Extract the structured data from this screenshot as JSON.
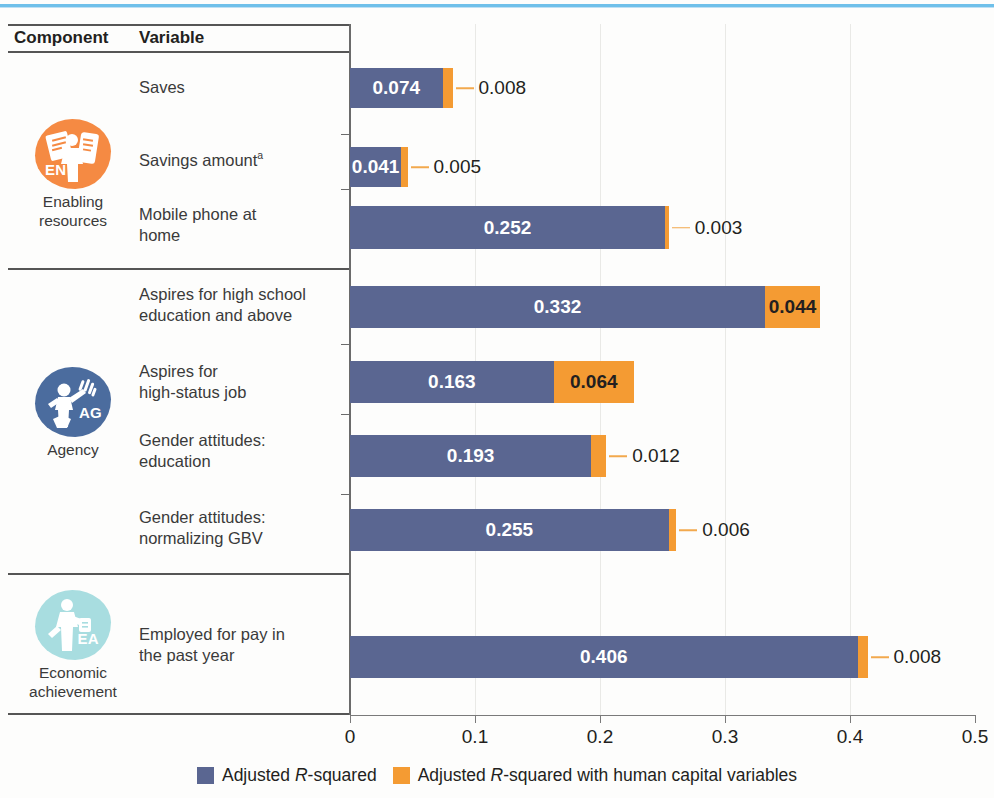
{
  "table": {
    "headers": {
      "component": "Component",
      "variable": "Variable"
    },
    "groups": [
      {
        "name": "Enabling\nresources",
        "name_line1": "Enabling",
        "name_line2": "resources",
        "code": "EN",
        "color": "#f58a43"
      },
      {
        "name": "Agency",
        "name_line1": "Agency",
        "name_line2": "",
        "code": "AG",
        "color": "#4b6c9e"
      },
      {
        "name": "Economic\nachievement",
        "name_line1": "Economic",
        "name_line2": "achievement",
        "code": "EA",
        "color": "#a8dde0"
      }
    ]
  },
  "chart_data": {
    "type": "bar",
    "orientation": "horizontal",
    "stacked": true,
    "title": "",
    "xlabel": "",
    "ylabel": "",
    "xlim": [
      0,
      0.5
    ],
    "xticks": [
      "0",
      "0.1",
      "0.2",
      "0.3",
      "0.4",
      "0.5"
    ],
    "xtick_values": [
      0,
      0.1,
      0.2,
      0.3,
      0.4,
      0.5
    ],
    "grid": true,
    "legend_position": "bottom",
    "categories": [
      "Saves",
      "Savings amount",
      "Mobile phone at home",
      "Aspires for high school education and above",
      "Aspires for high-status job",
      "Gender attitudes: education",
      "Gender attitudes: normalizing GBV",
      "Employed for pay in the past year"
    ],
    "series": [
      {
        "name": "Adjusted R-squared",
        "color": "#5a6691",
        "values": [
          0.074,
          0.041,
          0.252,
          0.332,
          0.163,
          0.193,
          0.255,
          0.406
        ]
      },
      {
        "name": "Adjusted R-squared with human capital variables",
        "color": "#f49b33",
        "values": [
          0.008,
          0.005,
          0.003,
          0.044,
          0.064,
          0.012,
          0.006,
          0.008
        ]
      }
    ]
  },
  "rows": [
    {
      "group": 0,
      "label_line1": "Saves",
      "label_line2": "",
      "sup": "",
      "blue": "0.074",
      "orange": "0.008",
      "orange_inside": false
    },
    {
      "group": 0,
      "label_line1": "Savings amount",
      "label_line2": "",
      "sup": "a",
      "blue": "0.041",
      "orange": "0.005",
      "orange_inside": false
    },
    {
      "group": 0,
      "label_line1": "Mobile phone at",
      "label_line2": "home",
      "sup": "",
      "blue": "0.252",
      "orange": "0.003",
      "orange_inside": false
    },
    {
      "group": 1,
      "label_line1": "Aspires for high school",
      "label_line2": "education and above",
      "sup": "",
      "blue": "0.332",
      "orange": "0.044",
      "orange_inside": true
    },
    {
      "group": 1,
      "label_line1": "Aspires for",
      "label_line2": "high-status job",
      "sup": "",
      "blue": "0.163",
      "orange": "0.064",
      "orange_inside": true
    },
    {
      "group": 1,
      "label_line1": "Gender attitudes:",
      "label_line2": "education",
      "sup": "",
      "blue": "0.193",
      "orange": "0.012",
      "orange_inside": false
    },
    {
      "group": 1,
      "label_line1": "Gender attitudes:",
      "label_line2": "normalizing GBV",
      "sup": "",
      "blue": "0.255",
      "orange": "0.006",
      "orange_inside": false
    },
    {
      "group": 2,
      "label_line1": "Employed for pay in",
      "label_line2": "the past year",
      "sup": "",
      "blue": "0.406",
      "orange": "0.008",
      "orange_inside": false
    }
  ],
  "legend": {
    "items": [
      {
        "label_pre": "Adjusted ",
        "label_italic": "R",
        "label_post": "-squared",
        "color": "#5a6691"
      },
      {
        "label_pre": "Adjusted ",
        "label_italic": "R",
        "label_post": "-squared with human capital variables",
        "color": "#f49b33"
      }
    ]
  }
}
